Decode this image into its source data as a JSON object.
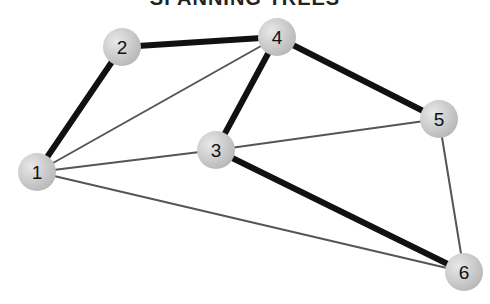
{
  "title": "SPANNING TREES",
  "colors": {
    "tree_edge": "#111111",
    "other_edge": "#555555",
    "node_fill": "#c8c8c8",
    "node_highlight": "#e6e6e6",
    "label": "#111111"
  },
  "nodes": [
    {
      "id": "1",
      "label": "1",
      "x": 37,
      "y": 172
    },
    {
      "id": "2",
      "label": "2",
      "x": 122,
      "y": 47
    },
    {
      "id": "3",
      "label": "3",
      "x": 216,
      "y": 150
    },
    {
      "id": "4",
      "label": "4",
      "x": 277,
      "y": 37
    },
    {
      "id": "5",
      "label": "5",
      "x": 439,
      "y": 119
    },
    {
      "id": "6",
      "label": "6",
      "x": 464,
      "y": 272
    }
  ],
  "edges": [
    {
      "from": "1",
      "to": "2",
      "in_tree": true
    },
    {
      "from": "2",
      "to": "4",
      "in_tree": true
    },
    {
      "from": "4",
      "to": "3",
      "in_tree": true
    },
    {
      "from": "4",
      "to": "5",
      "in_tree": true
    },
    {
      "from": "3",
      "to": "6",
      "in_tree": true
    },
    {
      "from": "1",
      "to": "4",
      "in_tree": false
    },
    {
      "from": "1",
      "to": "3",
      "in_tree": false
    },
    {
      "from": "1",
      "to": "6",
      "in_tree": false
    },
    {
      "from": "3",
      "to": "5",
      "in_tree": false
    },
    {
      "from": "5",
      "to": "6",
      "in_tree": false
    }
  ]
}
